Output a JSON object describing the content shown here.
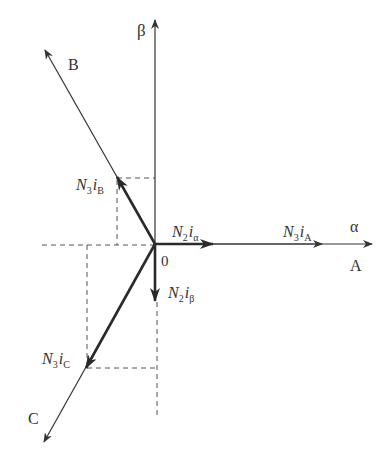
{
  "diagram": {
    "type": "vector-diagram",
    "axes": {
      "beta": "β",
      "alpha": "α",
      "phase_A": "A",
      "phase_B": "B",
      "phase_C": "C",
      "origin": "0"
    },
    "vectors": [
      {
        "id": "N3iA",
        "coef": "N",
        "sub1": "3",
        "var": "i",
        "sub2": "A"
      },
      {
        "id": "N3iB",
        "coef": "N",
        "sub1": "3",
        "var": "i",
        "sub2": "B"
      },
      {
        "id": "N3iC",
        "coef": "N",
        "sub1": "3",
        "var": "i",
        "sub2": "C"
      },
      {
        "id": "N2ialpha",
        "coef": "N",
        "sub1": "2",
        "var": "i",
        "sub2": "α"
      },
      {
        "id": "N2ibeta",
        "coef": "N",
        "sub1": "2",
        "var": "i",
        "sub2": "β"
      }
    ],
    "colors": {
      "line": "#333333",
      "bold": "#2a2a2a",
      "dash": "#555555"
    }
  }
}
